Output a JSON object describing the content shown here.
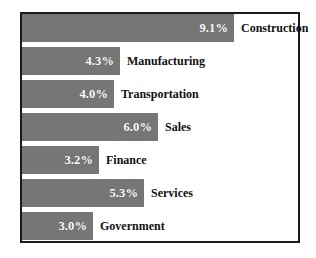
{
  "chart_data": {
    "type": "bar",
    "orientation": "horizontal",
    "title": "",
    "subtitle": "",
    "xlabel": "",
    "ylabel": "",
    "grid": false,
    "legend": "none",
    "value_suffix": "%",
    "xlim": [
      0,
      9.1
    ],
    "categories": [
      "Construction",
      "Manufacturing",
      "Transportation",
      "Sales",
      "Finance",
      "Services",
      "Government"
    ],
    "values": [
      9.1,
      4.3,
      4.0,
      6.0,
      3.2,
      5.3,
      3.0
    ],
    "value_labels": [
      "9.1%",
      "4.3%",
      "4.0%",
      "6.0%",
      "3.2%",
      "5.3%",
      "3.0%"
    ],
    "bar_color": "#767676",
    "value_text_color": "#ffffff",
    "label_text_color": "#111111",
    "frame_color": "#1b1b1b",
    "background": "#ffffff",
    "bars": [
      {
        "label": "Construction",
        "value": 9.1,
        "value_label": "9.1%",
        "bar_px": 212,
        "top_px": 0
      },
      {
        "label": "Manufacturing",
        "value": 4.3,
        "value_label": "4.3%",
        "bar_px": 98,
        "top_px": 33
      },
      {
        "label": "Transportation",
        "value": 4.0,
        "value_label": "4.0%",
        "bar_px": 92,
        "top_px": 66
      },
      {
        "label": "Sales",
        "value": 6.0,
        "value_label": "6.0%",
        "bar_px": 136,
        "top_px": 99
      },
      {
        "label": "Finance",
        "value": 3.2,
        "value_label": "3.2%",
        "bar_px": 77,
        "top_px": 132
      },
      {
        "label": "Services",
        "value": 5.3,
        "value_label": "5.3%",
        "bar_px": 122,
        "top_px": 165
      },
      {
        "label": "Government",
        "value": 3.0,
        "value_label": "3.0%",
        "bar_px": 71,
        "top_px": 198
      }
    ]
  }
}
